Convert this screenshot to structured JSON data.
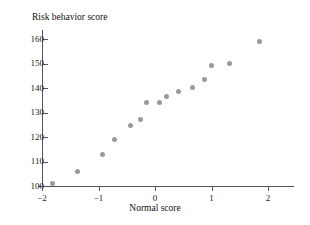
{
  "chart_data": {
    "type": "scatter",
    "title": "",
    "ylabel": "Risk behavior score",
    "xlabel": "Normal score",
    "xlim": [
      -2.35,
      2.2
    ],
    "ylim": [
      98,
      163
    ],
    "grid": false,
    "legend": null,
    "point_color": "#9a9a9a",
    "axis_color": "#555555",
    "xticks": [
      -2,
      -1,
      0,
      1,
      2
    ],
    "xtick_labels": [
      "−2",
      "−1",
      "0",
      "1",
      "2"
    ],
    "yticks": [
      100,
      110,
      120,
      130,
      140,
      150,
      160
    ],
    "ytick_labels": [
      "100",
      "110",
      "120",
      "130",
      "140",
      "150",
      "160"
    ],
    "x": [
      -1.82,
      -1.37,
      -0.93,
      -0.72,
      -0.44,
      -0.25,
      -0.16,
      0.07,
      0.21,
      0.42,
      0.67,
      0.88,
      1.0,
      1.32,
      1.84
    ],
    "y": [
      101.2,
      106.1,
      112.7,
      119.2,
      124.9,
      127.3,
      134.3,
      134.3,
      136.7,
      138.4,
      140.4,
      143.3,
      149.0,
      150.2,
      159.2
    ],
    "points": [
      {
        "x": -1.82,
        "y": 101.2
      },
      {
        "x": -1.37,
        "y": 106.1
      },
      {
        "x": -0.93,
        "y": 112.7
      },
      {
        "x": -0.72,
        "y": 119.2
      },
      {
        "x": -0.44,
        "y": 124.9
      },
      {
        "x": -0.25,
        "y": 127.3
      },
      {
        "x": -0.16,
        "y": 134.3
      },
      {
        "x": 0.07,
        "y": 134.3
      },
      {
        "x": 0.21,
        "y": 136.7
      },
      {
        "x": 0.42,
        "y": 138.4
      },
      {
        "x": 0.67,
        "y": 140.4
      },
      {
        "x": 0.88,
        "y": 143.3
      },
      {
        "x": 1.0,
        "y": 149.0
      },
      {
        "x": 1.32,
        "y": 150.2
      },
      {
        "x": 1.84,
        "y": 159.2
      }
    ]
  }
}
